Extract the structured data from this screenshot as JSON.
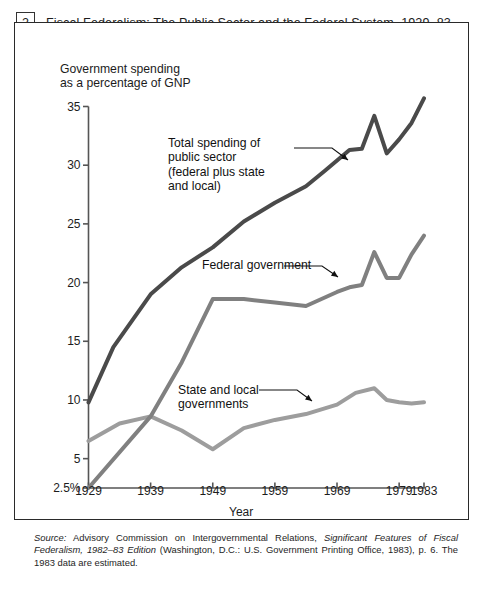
{
  "figure": {
    "number": "2",
    "title": "Fiscal Federalism: The Public Sector and the Federal System, 1929–83",
    "source_label": "Source:",
    "source_text": " Advisory Commission on Intergovernmental Relations, ",
    "source_italic_1": "Significant Features of Fiscal Federalism, 1982–83 Edition",
    "source_rest": " (Washington, D.C.: U.S. Government Printing Office, 1983), p. 6. The 1983 data are estimated."
  },
  "annotations": {
    "total": "Total spending of\npublic sector\n(federal plus state\nand local)",
    "federal": "Federal government",
    "state": "State and local\ngovernments"
  },
  "chart_data": {
    "type": "line",
    "title": "Fiscal Federalism: The Public Sector and the Federal System, 1929–83",
    "xlabel": "Year",
    "ylabel": "Government spending\nas a percentage of GNP",
    "xlim": [
      1929,
      1983
    ],
    "ylim": [
      2.5,
      35
    ],
    "grid": false,
    "legend": "inline-annotations",
    "xticks": [
      1929,
      1939,
      1949,
      1959,
      1969,
      1979,
      1983
    ],
    "xtick_labels": [
      "1929",
      "1939",
      "1949",
      "1959",
      "1969",
      "1979",
      "1983"
    ],
    "yticks": [
      2.5,
      5,
      10,
      15,
      20,
      25,
      30,
      35
    ],
    "ytick_labels": [
      "2.5%",
      "5",
      "10",
      "15",
      "20",
      "25",
      "30",
      "35"
    ],
    "series": [
      {
        "name": "Total spending of public sector (federal plus state and local)",
        "color": "#4a4a4a",
        "width": 4.0,
        "x": [
          1929,
          1933,
          1939,
          1944,
          1949,
          1954,
          1959,
          1964,
          1967,
          1969,
          1971,
          1973,
          1975,
          1977,
          1979,
          1981,
          1983
        ],
        "values": [
          9.8,
          14.5,
          19.0,
          21.3,
          23.0,
          25.2,
          26.8,
          28.2,
          29.5,
          30.4,
          31.3,
          31.4,
          34.2,
          31.0,
          32.2,
          33.6,
          35.7
        ]
      },
      {
        "name": "Federal government",
        "color": "#808080",
        "width": 4.0,
        "x": [
          1929,
          1939,
          1944,
          1949,
          1954,
          1959,
          1964,
          1969,
          1971,
          1973,
          1975,
          1977,
          1979,
          1981,
          1983
        ],
        "values": [
          2.5,
          8.6,
          13.2,
          18.6,
          18.6,
          18.3,
          18.0,
          19.2,
          19.6,
          19.8,
          22.6,
          20.4,
          20.4,
          22.4,
          24.0
        ]
      },
      {
        "name": "State and local governments",
        "color": "#9d9d9d",
        "width": 4.0,
        "x": [
          1929,
          1934,
          1939,
          1944,
          1949,
          1954,
          1959,
          1964,
          1969,
          1972,
          1975,
          1977,
          1979,
          1981,
          1983
        ],
        "values": [
          6.5,
          8.0,
          8.6,
          7.4,
          5.8,
          7.6,
          8.3,
          8.8,
          9.6,
          10.6,
          11.0,
          10.0,
          9.8,
          9.7,
          9.8
        ]
      }
    ],
    "annotation_arrows": [
      {
        "label": "Total spending of public sector (federal plus state and local)",
        "points_to": [
          1963,
          27.6
        ]
      },
      {
        "label": "Federal government",
        "points_to": [
          1961,
          18.4
        ]
      },
      {
        "label": "State and local governments",
        "points_to": [
          1956,
          8.0
        ]
      }
    ]
  }
}
